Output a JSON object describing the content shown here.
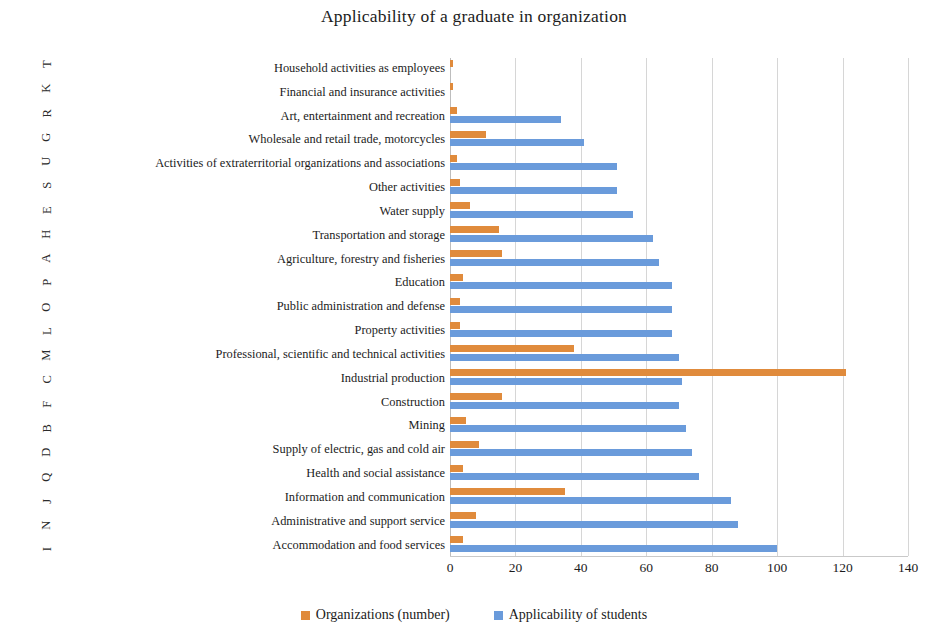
{
  "chart_data": {
    "type": "bar",
    "orientation": "horizontal",
    "title": "Applicability of a graduate in organization",
    "xlabel": "",
    "ylabel": "",
    "xlim": [
      0,
      140
    ],
    "xticks": [
      0,
      20,
      40,
      60,
      80,
      100,
      120,
      140
    ],
    "grid": true,
    "legend_position": "bottom",
    "categories": [
      "Household activities as employees",
      "Financial and insurance activities",
      "Art, entertainment and recreation",
      "Wholesale and retail trade, motorcycles",
      "Activities of extraterritorial organizations and associations",
      "Other activities",
      "Water supply",
      "Transportation and storage",
      "Agriculture, forestry and fisheries",
      "Education",
      "Public administration and defense",
      "Property activities",
      "Professional, scientific and technical activities",
      "Industrial production",
      "Construction",
      "Mining",
      "Supply of electric, gas and cold air",
      "Health and social assistance",
      "Information and communication",
      "Administrative and support service",
      "Accommodation and food services"
    ],
    "vertical_axis_letters": [
      "T",
      "K",
      "R",
      "G",
      "U",
      "S",
      "E",
      "H",
      "A",
      "P",
      "O",
      "L",
      "M",
      "C",
      "F",
      "B",
      "D",
      "Q",
      "J",
      "N",
      "I"
    ],
    "series": [
      {
        "name": "Organizations (number)",
        "color": "#e08b3c",
        "values": [
          1,
          1,
          2,
          11,
          2,
          3,
          6,
          15,
          16,
          4,
          3,
          3,
          38,
          121,
          16,
          5,
          9,
          4,
          35,
          8,
          4
        ]
      },
      {
        "name": "Applicability of students",
        "color": "#6a9bdb",
        "values": [
          0,
          0,
          34,
          41,
          51,
          51,
          56,
          62,
          64,
          68,
          68,
          68,
          70,
          71,
          70,
          72,
          74,
          76,
          86,
          88,
          100
        ]
      }
    ]
  },
  "legend": {
    "items": [
      {
        "label": "Organizations (number)",
        "color": "#e08b3c"
      },
      {
        "label": "Applicability of students",
        "color": "#6a9bdb"
      }
    ]
  }
}
